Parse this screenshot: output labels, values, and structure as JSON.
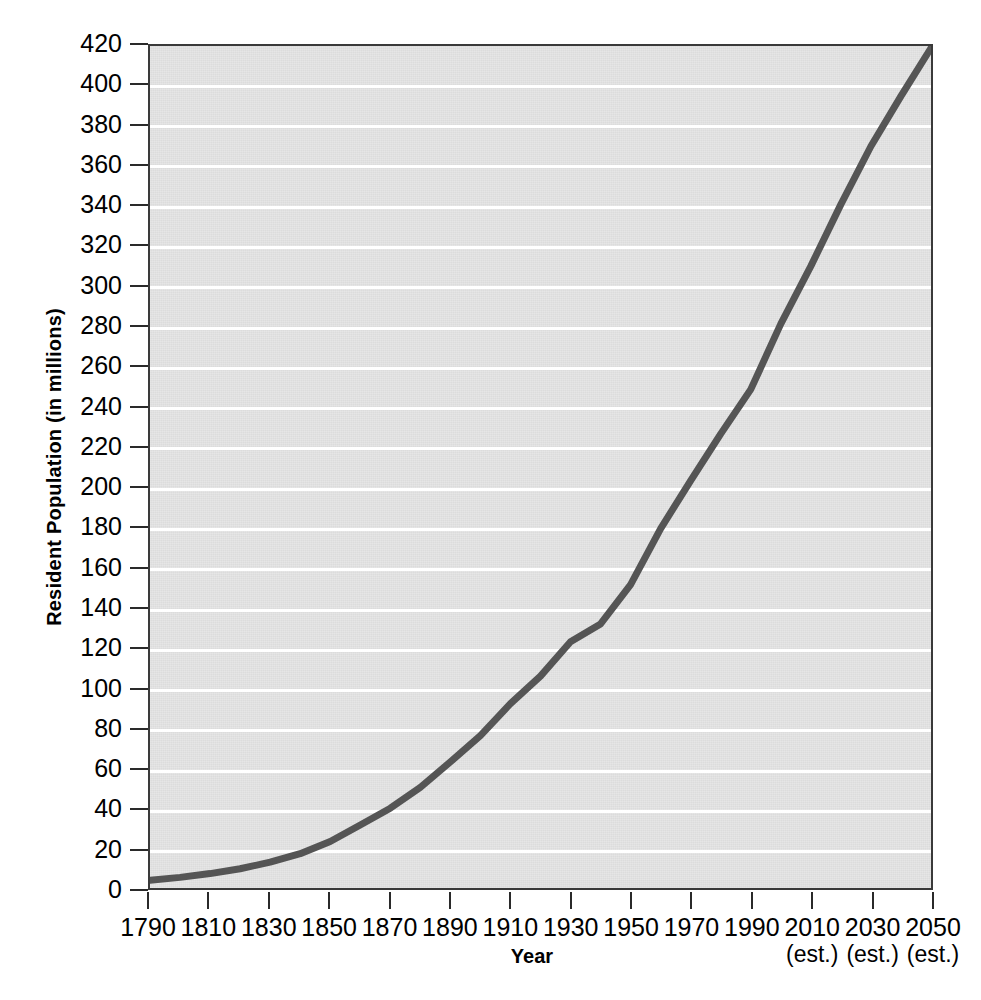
{
  "chart_data": {
    "type": "line",
    "title": "",
    "xlabel": "Year",
    "ylabel": "Resident Population (in millions)",
    "xlim": [
      1790,
      2050
    ],
    "ylim": [
      0,
      420
    ],
    "grid": true,
    "legend": "none",
    "line_color": "#555555",
    "plot_background": "#dcdcdc",
    "gridline_color": "#ffffff",
    "axis_color": "#3a3a3a",
    "y_ticks": [
      0,
      20,
      40,
      60,
      80,
      100,
      120,
      140,
      160,
      180,
      200,
      220,
      240,
      260,
      280,
      300,
      320,
      340,
      360,
      380,
      400,
      420
    ],
    "x_ticks": [
      {
        "label": "1790",
        "sublabel": "",
        "value": 1790
      },
      {
        "label": "1810",
        "sublabel": "",
        "value": 1810
      },
      {
        "label": "1830",
        "sublabel": "",
        "value": 1830
      },
      {
        "label": "1850",
        "sublabel": "",
        "value": 1850
      },
      {
        "label": "1870",
        "sublabel": "",
        "value": 1870
      },
      {
        "label": "1890",
        "sublabel": "",
        "value": 1890
      },
      {
        "label": "1910",
        "sublabel": "",
        "value": 1910
      },
      {
        "label": "1930",
        "sublabel": "",
        "value": 1930
      },
      {
        "label": "1950",
        "sublabel": "",
        "value": 1950
      },
      {
        "label": "1970",
        "sublabel": "",
        "value": 1970
      },
      {
        "label": "1990",
        "sublabel": "",
        "value": 1990
      },
      {
        "label": "2010",
        "sublabel": "(est.)",
        "value": 2010
      },
      {
        "label": "2030",
        "sublabel": "(est.)",
        "value": 2030
      },
      {
        "label": "2050",
        "sublabel": "(est.)",
        "value": 2050
      }
    ],
    "x": [
      1790,
      1800,
      1810,
      1820,
      1830,
      1840,
      1850,
      1860,
      1870,
      1880,
      1890,
      1900,
      1910,
      1920,
      1930,
      1940,
      1950,
      1960,
      1970,
      1980,
      1990,
      2000,
      2010,
      2020,
      2030,
      2040,
      2050
    ],
    "values": [
      3.9,
      5.3,
      7.2,
      9.6,
      12.9,
      17.1,
      23.2,
      31.4,
      39.8,
      50.2,
      62.9,
      76.0,
      92.0,
      105.7,
      122.8,
      131.7,
      151.3,
      179.3,
      203.2,
      226.5,
      248.7,
      281.4,
      310.2,
      341.0,
      370.0,
      395.0,
      419.0
    ],
    "series": [
      {
        "name": "Resident Population",
        "values": [
          3.9,
          5.3,
          7.2,
          9.6,
          12.9,
          17.1,
          23.2,
          31.4,
          39.8,
          50.2,
          62.9,
          76.0,
          92.0,
          105.7,
          122.8,
          131.7,
          151.3,
          179.3,
          203.2,
          226.5,
          248.7,
          281.4,
          310.2,
          341.0,
          370.0,
          395.0,
          419.0
        ]
      }
    ]
  }
}
